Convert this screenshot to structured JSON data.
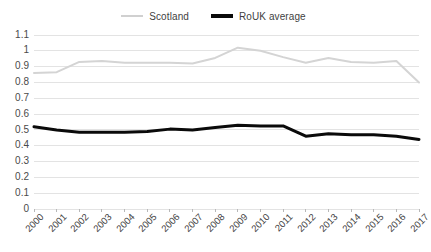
{
  "chart_data": {
    "type": "line",
    "title": "",
    "xlabel": "",
    "ylabel": "",
    "categories": [
      "2000",
      "2001",
      "2002",
      "2003",
      "2004",
      "2005",
      "2006",
      "2007",
      "2008",
      "2009",
      "2010",
      "2011",
      "2012",
      "2013",
      "2014",
      "2015",
      "2016",
      "2017"
    ],
    "ylim": [
      0,
      1.1
    ],
    "ytick_labels": [
      "1.1",
      "1",
      "0.9",
      "0.8",
      "0.7",
      "0.6",
      "0.5",
      "0.4",
      "0.3",
      "0.2",
      "0.1",
      "0"
    ],
    "ytick_values": [
      1.1,
      1.0,
      0.9,
      0.8,
      0.7,
      0.6,
      0.5,
      0.4,
      0.3,
      0.2,
      0.1,
      0
    ],
    "grid": true,
    "legend_position": "top-center",
    "series": [
      {
        "name": "Scotland",
        "color": "#d4d4d4",
        "width": 2,
        "values": [
          0.86,
          0.865,
          0.93,
          0.935,
          0.925,
          0.925,
          0.925,
          0.92,
          0.955,
          1.02,
          1.0,
          0.96,
          0.925,
          0.955,
          0.93,
          0.925,
          0.935,
          0.8
        ]
      },
      {
        "name": "RoUK average",
        "color": "#0a0a0a",
        "width": 3,
        "values": [
          0.52,
          0.5,
          0.485,
          0.485,
          0.485,
          0.49,
          0.505,
          0.5,
          0.515,
          0.53,
          0.525,
          0.525,
          0.46,
          0.475,
          0.47,
          0.47,
          0.46,
          0.44
        ]
      }
    ]
  },
  "legend": {
    "entries": [
      {
        "label": "Scotland"
      },
      {
        "label": "RoUK average"
      }
    ]
  }
}
